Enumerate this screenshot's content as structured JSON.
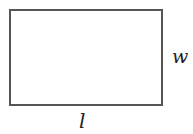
{
  "diagram": {
    "shape": "rectangle",
    "stroke_color": "#555555",
    "labels": {
      "width": "w",
      "length": "l"
    }
  }
}
